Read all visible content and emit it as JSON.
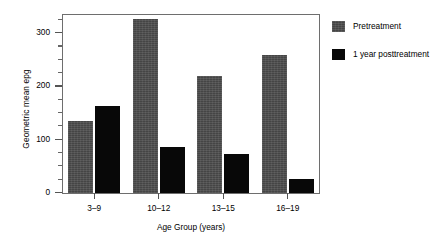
{
  "chart_data": {
    "type": "bar",
    "title": "",
    "xlabel": "Age Group (years)",
    "ylabel": "Geometric mean epg",
    "categories": [
      "3–9",
      "10–12",
      "13–15",
      "16–19"
    ],
    "series": [
      {
        "name": "Pretreatment",
        "color": "#454545",
        "values": [
          135,
          326,
          218,
          259
        ]
      },
      {
        "name": "1 year posttreatment",
        "color": "#080808",
        "values": [
          163,
          86,
          73,
          26
        ]
      }
    ],
    "ylim": [
      0,
      335
    ],
    "ytick_labels": [
      "0",
      "100",
      "200",
      "300"
    ],
    "ytick_values": [
      0,
      100,
      200,
      300
    ],
    "yminor_step": 25,
    "grid": false,
    "legend_position": "right",
    "frame": "left-top-right"
  },
  "legend": {
    "entries": [
      {
        "label": "Pretreatment"
      },
      {
        "label": "1 year posttreatment"
      }
    ]
  }
}
